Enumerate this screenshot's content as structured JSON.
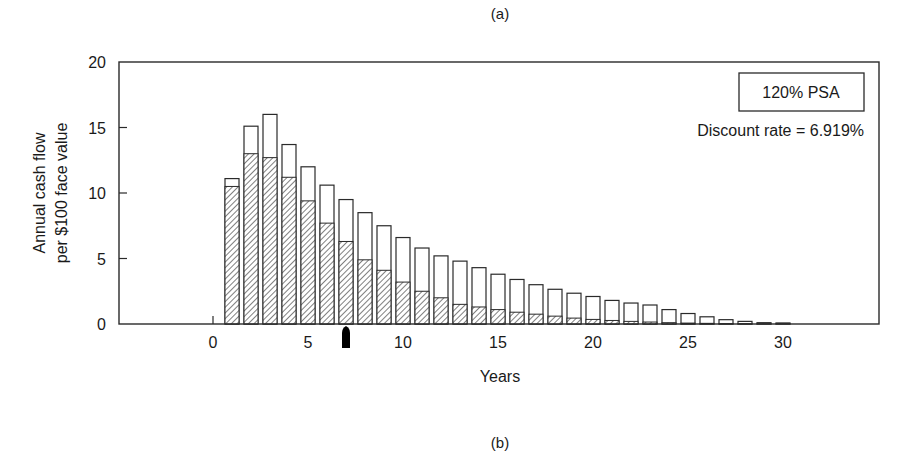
{
  "captions": {
    "top": "(a)",
    "bottom": "(b)"
  },
  "legend": {
    "scenario": "120% PSA",
    "discount": "Discount rate = 6.919%"
  },
  "colors": {
    "outline": "#2a2a2a",
    "hatch": "#3a3a3a",
    "bar_fill": "#ffffff",
    "marker": "#000000"
  },
  "chart_data": {
    "type": "bar",
    "title": "",
    "xlabel": "Years",
    "ylabel": "Annual cash flow per $100 face value",
    "ylabel_lines": [
      "Annual cash flow",
      "per $100 face value"
    ],
    "xlim": [
      -5,
      35
    ],
    "ylim": [
      0,
      20
    ],
    "x_ticks": [
      0,
      5,
      10,
      15,
      20,
      25,
      30
    ],
    "y_ticks": [
      0,
      5,
      10,
      15,
      20
    ],
    "grid": false,
    "legend_position": "upper right",
    "annotations": [
      "120% PSA",
      "Discount rate = 6.919%",
      "arrow marker at year 7"
    ],
    "marker_year": 7,
    "x": [
      1,
      2,
      3,
      4,
      5,
      6,
      7,
      8,
      9,
      10,
      11,
      12,
      13,
      14,
      15,
      16,
      17,
      18,
      19,
      20,
      21,
      22,
      23,
      24,
      25,
      26,
      27,
      28,
      29,
      30
    ],
    "series": [
      {
        "name": "Total cash flow (outlined bar)",
        "values": [
          11.1,
          15.1,
          16.0,
          13.7,
          12.0,
          10.6,
          9.5,
          8.5,
          7.5,
          6.6,
          5.8,
          5.2,
          4.8,
          4.3,
          3.8,
          3.4,
          3.0,
          2.65,
          2.35,
          2.1,
          1.8,
          1.6,
          1.45,
          1.1,
          0.8,
          0.55,
          0.33,
          0.2,
          0.1,
          0.08
        ]
      },
      {
        "name": "Hatched portion",
        "values": [
          10.5,
          13.0,
          12.7,
          11.2,
          9.4,
          7.7,
          6.3,
          4.9,
          4.1,
          3.2,
          2.5,
          2.0,
          1.5,
          1.3,
          1.1,
          0.9,
          0.75,
          0.6,
          0.45,
          0.35,
          0.27,
          0.2,
          0.15,
          0.1,
          0.07,
          0.05,
          0.03,
          0.02,
          0.01,
          0.01
        ]
      }
    ]
  }
}
